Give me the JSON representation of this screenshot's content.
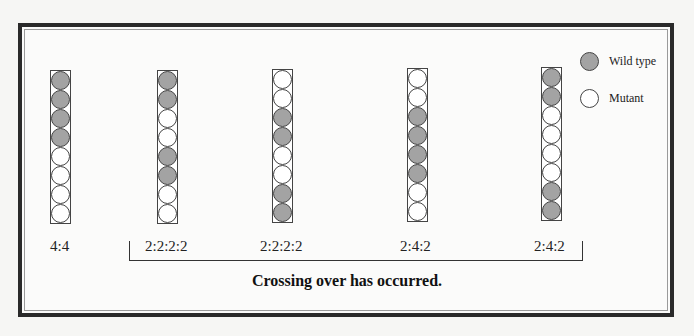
{
  "legend": {
    "items": [
      {
        "label": "Wild type",
        "color": "#a3a3a3"
      },
      {
        "label": "Mutant",
        "color": "#ffffff"
      }
    ]
  },
  "asci": [
    {
      "ratio": "4:4",
      "spores": [
        "W",
        "W",
        "W",
        "W",
        "M",
        "M",
        "M",
        "M"
      ]
    },
    {
      "ratio": "2:2:2:2",
      "spores": [
        "W",
        "W",
        "M",
        "M",
        "W",
        "W",
        "M",
        "M"
      ]
    },
    {
      "ratio": "2:2:2:2",
      "spores": [
        "M",
        "M",
        "W",
        "W",
        "M",
        "M",
        "W",
        "W"
      ]
    },
    {
      "ratio": "2:4:2",
      "spores": [
        "M",
        "M",
        "W",
        "W",
        "W",
        "W",
        "M",
        "M"
      ]
    },
    {
      "ratio": "2:4:2",
      "spores": [
        "W",
        "W",
        "M",
        "M",
        "M",
        "M",
        "W",
        "W"
      ]
    }
  ],
  "caption": "Crossing over has occurred."
}
